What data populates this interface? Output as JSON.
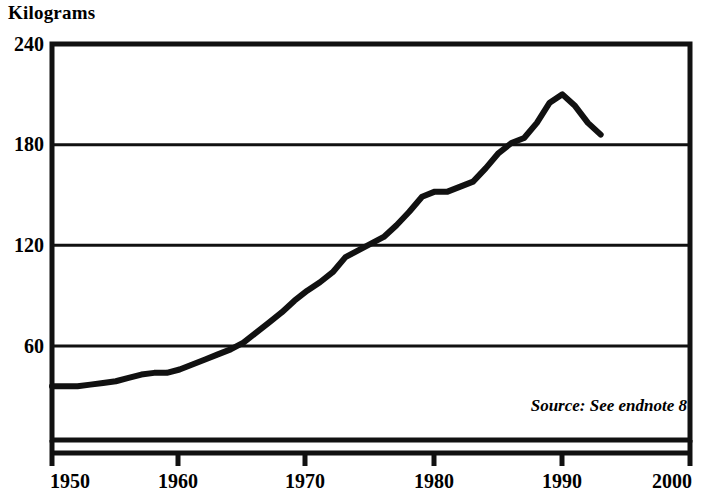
{
  "chart_data": {
    "type": "line",
    "title": "",
    "ylabel": "Kilograms",
    "xlabel": "",
    "ylim": [
      0,
      240
    ],
    "xlim": [
      1950,
      2000
    ],
    "grid": true,
    "legend": null,
    "y_ticks": [
      60,
      120,
      180,
      240
    ],
    "y_tick_labels": [
      "60",
      "120",
      "180",
      "240"
    ],
    "x_ticks": [
      1950,
      1960,
      1970,
      1980,
      1990,
      2000
    ],
    "x_tick_labels": [
      "1950",
      "1960",
      "1970",
      "1980",
      "1990",
      "2000"
    ],
    "annotations": [
      {
        "text": "Source: See endnote 8",
        "position": "bottom-right",
        "style": "italic"
      }
    ],
    "line_color": "#111111",
    "line_width_px": 6,
    "series": [
      {
        "name": "Kilograms",
        "x": [
          1950,
          1951,
          1952,
          1953,
          1954,
          1955,
          1956,
          1957,
          1958,
          1959,
          1960,
          1961,
          1962,
          1963,
          1964,
          1965,
          1966,
          1967,
          1968,
          1969,
          1970,
          1971,
          1972,
          1973,
          1974,
          1975,
          1976,
          1977,
          1978,
          1979,
          1980,
          1981,
          1982,
          1983,
          1984,
          1985,
          1986,
          1987,
          1988,
          1989,
          1990,
          1991,
          1992,
          1993
        ],
        "values": [
          36,
          36,
          36,
          37,
          38,
          39,
          41,
          43,
          44,
          44,
          46,
          49,
          52,
          55,
          58,
          62,
          68,
          74,
          80,
          87,
          93,
          98,
          104,
          113,
          117,
          121,
          125,
          132,
          140,
          149,
          152,
          152,
          155,
          158,
          166,
          175,
          181,
          184,
          193,
          205,
          210,
          203,
          193,
          186
        ]
      }
    ]
  },
  "axes": {
    "y_title": "Kilograms",
    "y_labels": [
      "240",
      "180",
      "120",
      "60"
    ],
    "x_labels": [
      "1950",
      "1960",
      "1970",
      "1980",
      "1990",
      "2000"
    ]
  },
  "source": {
    "text": "Source: See endnote 8"
  },
  "colors": {
    "ink": "#111111",
    "background": "#ffffff"
  }
}
